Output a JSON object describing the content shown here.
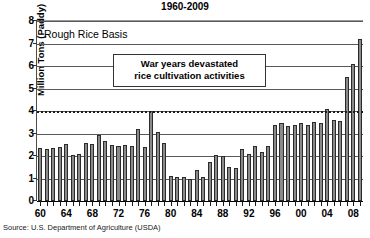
{
  "chart_data": {
    "type": "bar",
    "title": "1960-2009",
    "series_label": "Rough Rice Basis",
    "xlabel": "",
    "ylabel": "Million Tons (Paddy)",
    "ylim": [
      0,
      8
    ],
    "ytick_values": [
      0,
      1,
      2,
      3,
      4,
      5,
      6,
      7,
      8
    ],
    "ytick_labels": [
      "0",
      "1",
      "2",
      "3",
      "4",
      "5",
      "6",
      "7",
      "8"
    ],
    "grid": true,
    "reference_line": {
      "value": 4,
      "style": "dashed"
    },
    "xtick_labels": [
      "60",
      "64",
      "68",
      "72",
      "76",
      "80",
      "84",
      "88",
      "92",
      "96",
      "00",
      "04",
      "08"
    ],
    "xtick_years": [
      1960,
      1964,
      1968,
      1972,
      1976,
      1980,
      1984,
      1988,
      1992,
      1996,
      2000,
      2004,
      2008
    ],
    "categories": [
      "1960",
      "1961",
      "1962",
      "1963",
      "1964",
      "1965",
      "1966",
      "1967",
      "1968",
      "1969",
      "1970",
      "1971",
      "1972",
      "1973",
      "1974",
      "1975",
      "1976",
      "1977",
      "1978",
      "1979",
      "1980",
      "1981",
      "1982",
      "1983",
      "1984",
      "1985",
      "1986",
      "1987",
      "1988",
      "1989",
      "1990",
      "1991",
      "1992",
      "1993",
      "1994",
      "1995",
      "1996",
      "1997",
      "1998",
      "1999",
      "2000",
      "2001",
      "2002",
      "2003",
      "2004",
      "2005",
      "2006",
      "2007",
      "2008",
      "2009"
    ],
    "values": [
      2.35,
      2.3,
      2.35,
      2.4,
      2.55,
      2.05,
      2.1,
      2.6,
      2.55,
      2.95,
      2.65,
      2.5,
      2.45,
      2.5,
      2.45,
      3.2,
      2.4,
      4.0,
      3.05,
      2.6,
      1.1,
      1.05,
      1.05,
      1.0,
      1.4,
      1.05,
      1.75,
      2.05,
      2.0,
      1.5,
      1.45,
      2.3,
      2.1,
      2.45,
      2.2,
      2.45,
      3.4,
      3.45,
      3.35,
      3.4,
      3.45,
      3.4,
      3.5,
      3.45,
      4.1,
      3.6,
      3.55,
      5.5,
      6.1,
      7.2
    ],
    "annotation": {
      "line1": "War years devastated",
      "line2": "rice cultivation activities"
    },
    "source": "Source: U.S. Department of Agriculture (USDA)",
    "colors": {
      "bar_fill": "#8a8a8a",
      "bar_stroke": "#2b2b2b",
      "grid": "#595959",
      "axis": "#1a1a1a",
      "background": "#ffffff"
    }
  }
}
